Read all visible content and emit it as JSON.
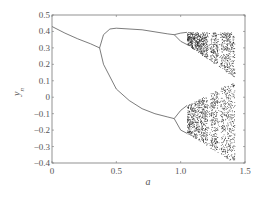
{
  "chart_data": {
    "type": "scatter",
    "title": "",
    "subtitle": "bifurcation diagram",
    "xlabel": "a",
    "ylabel": "y_n",
    "xlim": [
      0,
      1.5
    ],
    "ylim": [
      -0.4,
      0.5
    ],
    "xticks": [
      "0",
      "0.5",
      "1.0",
      "1.5"
    ],
    "xtick_values": [
      0,
      0.5,
      1.0,
      1.5
    ],
    "yticks": [
      "0.5",
      "0.4",
      "0.3",
      "0.2",
      "0.1",
      "0",
      "-0.1",
      "-0.2",
      "-0.3",
      "-0.4"
    ],
    "ytick_values": [
      0.5,
      0.4,
      0.3,
      0.2,
      0.1,
      0,
      -0.1,
      -0.2,
      -0.3,
      -0.4
    ],
    "grid": false,
    "legend": null,
    "series": [
      {
        "name": "fixed point",
        "x": [
          0,
          0.1,
          0.2,
          0.3,
          0.37
        ],
        "y": [
          0.43,
          0.39,
          0.355,
          0.325,
          0.3
        ]
      },
      {
        "name": "period-2 upper",
        "x": [
          0.37,
          0.4,
          0.45,
          0.5,
          0.7,
          0.9,
          0.95
        ],
        "y": [
          0.3,
          0.38,
          0.415,
          0.42,
          0.41,
          0.385,
          0.38
        ]
      },
      {
        "name": "period-2 lower",
        "x": [
          0.37,
          0.4,
          0.5,
          0.6,
          0.7,
          0.8,
          0.9,
          0.95
        ],
        "y": [
          0.3,
          0.2,
          0.05,
          -0.02,
          -0.07,
          -0.1,
          -0.12,
          -0.13
        ]
      },
      {
        "name": "period-4 upper",
        "x": [
          0.95,
          1.0,
          1.05
        ],
        "y_top": [
          0.38,
          0.39,
          0.395
        ],
        "y_bottom": [
          0.38,
          0.34,
          0.32
        ]
      },
      {
        "name": "period-4 lower",
        "x": [
          0.95,
          1.0,
          1.05
        ],
        "y_top": [
          -0.13,
          -0.08,
          -0.05
        ],
        "y_bottom": [
          -0.13,
          -0.2,
          -0.22
        ]
      },
      {
        "name": "chaotic region",
        "x_range": [
          1.05,
          1.42
        ],
        "y_upper_band": [
          0.15,
          0.4
        ],
        "y_lower_band": [
          -0.4,
          0.1
        ],
        "periodic_windows_a": [
          1.22,
          1.3
        ]
      }
    ]
  }
}
